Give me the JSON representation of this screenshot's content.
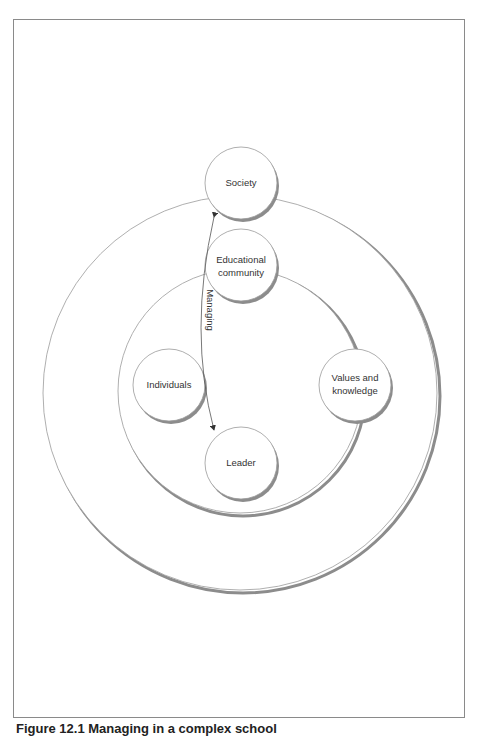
{
  "figure": {
    "caption": "Figure 12.1 Managing in a complex school",
    "outer_ring": {
      "label": "Society context",
      "cx": 240,
      "cy": 393,
      "r": 197
    },
    "inner_ring": {
      "label": "Educational community context",
      "cx": 240,
      "cy": 391,
      "r": 122
    },
    "nodes": [
      {
        "id": "society",
        "lines": [
          "Society"
        ],
        "cx": 241,
        "cy": 183,
        "r": 36
      },
      {
        "id": "educational-community",
        "lines": [
          "Educational",
          "community"
        ],
        "cx": 241,
        "cy": 265,
        "r": 36
      },
      {
        "id": "individuals",
        "lines": [
          "Individuals"
        ],
        "cx": 169,
        "cy": 385,
        "r": 36
      },
      {
        "id": "values-and-knowledge",
        "lines": [
          "Values and",
          "knowledge"
        ],
        "cx": 355,
        "cy": 385,
        "r": 36
      },
      {
        "id": "leader",
        "lines": [
          "Leader"
        ],
        "cx": 241,
        "cy": 463,
        "r": 36
      }
    ],
    "arrow": {
      "label": "Managing",
      "from": "leader",
      "to": "society",
      "bidirectional": true
    }
  },
  "colors": {
    "stroke": "#9a9a9a",
    "shadow": "#8c8c8c",
    "text": "#333333",
    "frame": "#8a8a8a"
  }
}
